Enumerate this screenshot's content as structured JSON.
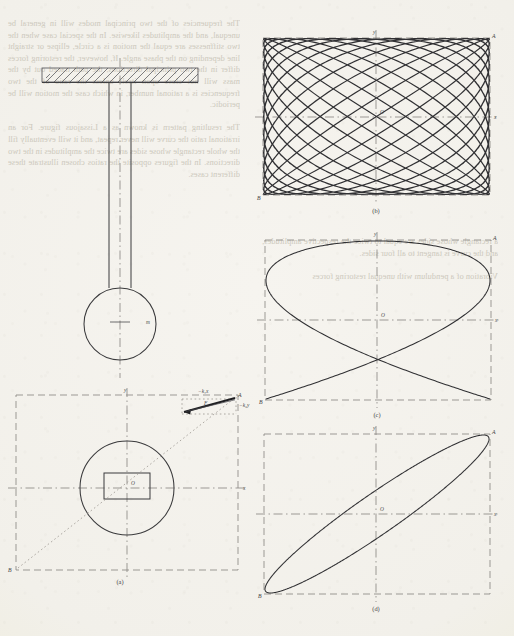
{
  "page": {
    "background_color": "#f2f0ea",
    "ink_color": "#303033",
    "construction_line_color": "#8d8a84",
    "bleed_text_color": "#c9c5b8"
  },
  "bleed_text": {
    "left_column": "The frequencies of the two principal modes will in general be unequal, and the amplitudes likewise. In the special case when the two stiffnesses are equal the motion is a circle, ellipse or straight line depending on the phase angle. If, however, the restoring forces differ in the two principal directions, the path traced out by the mass will not close upon itself unless the ratio of the two frequencies is a rational number, in which case the motion will be periodic.\n\nThe resulting pattern is known as a Lissajous figure. For an irrational ratio the curve will never repeat, and it will eventually fill the whole rectangle whose sides are twice the amplitudes in the two directions. In the figures opposite the ratios chosen illustrate these different cases.",
    "right_column": "a rectangle whose sides are equal to twice the respective amplitudes, and the curve is tangent to all four sides.\n\nVibration of a pendulum with unequal restoring forces"
  },
  "figures": [
    {
      "id": "elevation",
      "caption": "",
      "name": "pendulum-elevation-view",
      "parts": {
        "support_hatching": "hatched-ceiling",
        "rod": "suspension-rod",
        "bob": "pendulum-bob",
        "mass_label": "m",
        "centre_line": "vertical-centre-line"
      }
    },
    {
      "id": "a",
      "caption": "(a)",
      "name": "plan-view-with-force-vectors",
      "labels": {
        "origin": "O",
        "x_axis": "x",
        "y_axis": "y",
        "corner_a": "A",
        "corner_b": "B",
        "force_x": "−k₁x",
        "force_y": "−k₂y",
        "resultant": "F"
      }
    },
    {
      "id": "b",
      "caption": "(b)",
      "name": "lissajous-high-frequency-ratio",
      "labels": {
        "origin": "O",
        "x_axis": "x",
        "y_axis": "y",
        "corner_a": "A",
        "corner_b": "B"
      }
    },
    {
      "id": "c",
      "caption": "(c)",
      "name": "lissajous-low-frequency-ratio",
      "labels": {
        "origin": "O",
        "x_axis": "x",
        "y_axis": "y",
        "corner_a": "A",
        "corner_b": "B"
      }
    },
    {
      "id": "d",
      "caption": "(d)",
      "name": "lissajous-tilted-ellipse",
      "labels": {
        "origin": "O",
        "x_axis": "x",
        "y_axis": "y",
        "corner_a": "A",
        "corner_b": "B"
      }
    }
  ],
  "chart_data": [
    {
      "type": "line",
      "id": "b",
      "title": "(b)",
      "description": "Lissajous figure, nearly-equal frequency ratio, dense crossing pattern filling the bounding rectangle",
      "parametric": {
        "x": "A*sin(w1*t)",
        "y": "B*sin(w2*t + phi)"
      },
      "frequency_ratio": [
        13,
        12
      ],
      "phase_deg": 0,
      "amplitude_x": 1.0,
      "amplitude_y": 1.0,
      "xlim": [
        -1,
        1
      ],
      "ylim": [
        -1,
        1
      ],
      "xlabel": "x",
      "ylabel": "y",
      "grid": false,
      "legend": "none"
    },
    {
      "type": "line",
      "id": "c",
      "title": "(c)",
      "description": "Lissajous figure, 3:2 frequency ratio",
      "parametric": {
        "x": "A*sin(w1*t)",
        "y": "B*sin(w2*t + phi)"
      },
      "frequency_ratio": [
        3,
        2
      ],
      "phase_deg": 90,
      "amplitude_x": 1.0,
      "amplitude_y": 1.0,
      "xlim": [
        -1,
        1
      ],
      "ylim": [
        -1,
        1
      ],
      "xlabel": "x",
      "ylabel": "y",
      "grid": false,
      "legend": "none"
    },
    {
      "type": "line",
      "id": "d",
      "title": "(d)",
      "description": "Lissajous figure, 1:1 frequency ratio with phase difference - a tilted ellipse inscribed in the rectangle",
      "parametric": {
        "x": "A*sin(w1*t)",
        "y": "B*sin(w2*t + phi)"
      },
      "frequency_ratio": [
        1,
        1
      ],
      "phase_deg": 18,
      "amplitude_x": 1.0,
      "amplitude_y": 1.0,
      "xlim": [
        -1,
        1
      ],
      "ylim": [
        -1,
        1
      ],
      "xlabel": "x",
      "ylabel": "y",
      "grid": false,
      "legend": "none"
    }
  ]
}
